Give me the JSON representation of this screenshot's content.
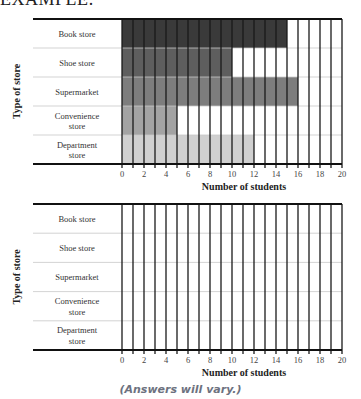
{
  "heading": "EXAMPLE:",
  "caption": "(Answers will vary.)",
  "chart_data": [
    {
      "type": "bar",
      "orientation": "horizontal",
      "title": "",
      "categories": [
        [
          "Book store"
        ],
        [
          "Shoe store"
        ],
        [
          "Supermarket"
        ],
        [
          "Convenience",
          "store"
        ],
        [
          "Department",
          "store"
        ]
      ],
      "values": [
        15,
        10,
        16,
        5,
        12
      ],
      "colors": [
        "#3a3a3a",
        "#5e5e5e",
        "#7d7d7d",
        "#a3a3a3",
        "#d0d0d0"
      ],
      "xlabel": "Number of students",
      "ylabel": "Type of store",
      "xlim": [
        0,
        20
      ],
      "xticks": [
        0,
        2,
        4,
        6,
        8,
        10,
        12,
        14,
        16,
        18,
        20
      ],
      "grid": true
    },
    {
      "type": "bar",
      "orientation": "horizontal",
      "title": "",
      "categories": [
        [
          "Book store"
        ],
        [
          "Shoe store"
        ],
        [
          "Supermarket"
        ],
        [
          "Convenience",
          "store"
        ],
        [
          "Department",
          "store"
        ]
      ],
      "values": [],
      "colors": [],
      "xlabel": "Number of students",
      "ylabel": "Type of store",
      "xlim": [
        0,
        20
      ],
      "xticks": [
        0,
        2,
        4,
        6,
        8,
        10,
        12,
        14,
        16,
        18,
        20
      ],
      "grid": true
    }
  ]
}
